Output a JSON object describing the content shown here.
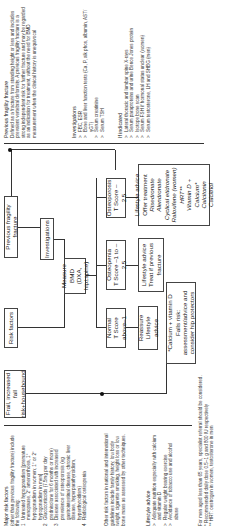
{
  "left_notes": {
    "major_risk": {
      "heading": "Major risk factors",
      "intro": "(other than previous fragility fracture) include the following:",
      "items": [
        {
          "marker": "1",
          "text": "Untreated hypogonadism [premature menopause, 2° amenorrhoea, 1° hypogonadism in women; 1° or 2° hypogonadism in men]"
        },
        {
          "marker": "2",
          "text": "Glucocorticoids (7.5mg per day prednisolone for 6 months or more)"
        },
        {
          "marker": "3",
          "text": "Disease associated with increased prevalence of osteoporosis (eg gastrointestinal disease, chronic liver disease, hyperparathyroidism, hyperthyroidism)"
        },
        {
          "marker": "4",
          "text": "Radiological osteopenia"
        }
      ]
    },
    "other_risk": "Other risk factors in national and international guidelines include family history, low body weight, cigarette smoking, height loss or low bone mass as assessed by other techniques.",
    "lifestyle": {
      "heading": "Lifestyle advice",
      "items": [
        {
          "marker": ">",
          "text": "Adequate nutrition especially with calcium and vitamin D"
        },
        {
          "marker": ">",
          "text": "Regular weight bearing exercise"
        },
        {
          "marker": ">",
          "text": "Avoidance of tobacco use and alcohol abuse"
        }
      ]
    },
    "footnotes": [
      "For men aged less than 65 years, specialist referral should be considered.",
      "* Recommended daily dose 0.5–1 g and 800 IU respectively",
      "** HRT: oestrogen in women, testosterone in men"
    ]
  },
  "flow": {
    "frail": "Frail, increased fall risk+housebound",
    "risk_factors": "Risk factors",
    "previous_fracture": "Previous fragility fracture",
    "investigations": "Investigations",
    "measure_bmd": [
      "Measure BMD",
      "(DXA, hip±spine)"
    ],
    "normal": [
      "Normal",
      "T Score above–1"
    ],
    "osteopenia": [
      "Osteopenia",
      "T Score –1 to –2.5"
    ],
    "osteoporosis": [
      "Osteoporosis",
      "T Score –2.5"
    ],
    "reassure": [
      "Reassure",
      "Lifestyle advice"
    ],
    "treat_if": [
      "Lifestyle advice",
      "Treat if previous",
      "fracture"
    ],
    "offer_treatment": {
      "lines": [
        "Lifestyle advice",
        "Offer treatment"
      ],
      "drugs": [
        "Risedronate",
        "Alendronate",
        "Cyclical etidronate",
        "Raloxifene (women)",
        "HRT**",
        "Vitamin D + Calcium*",
        "Calcitonin",
        "Calcitriol"
      ]
    },
    "calcium": [
      "*Calcium + vitamin D",
      "Falls risk:",
      "assessment/advice and",
      "consider hip protectors"
    ]
  },
  "right_notes": {
    "fracture_def": {
      "heading": "Previous fragility fracture",
      "text": "Defined as a fracture from standing height or less and includes prevalent vertebral deformity. A previous fragility fracture is a strong independent risk for further fracture and may be regarded as an indication for treatment, without the need for BMD measurement when the clinical history is unequivocal"
    },
    "investigations": {
      "heading": "Investigations",
      "items": [
        {
          "marker": ">",
          "text": "FBC, ESR"
        },
        {
          "marker": ">",
          "text": "Bone and liver function tests (Ca, P, alk phos, albumin, AST/γGT)"
        },
        {
          "marker": ">",
          "text": "Serum creatinine"
        },
        {
          "marker": ">",
          "text": "Serum TSH"
        }
      ]
    },
    "if_indicated": {
      "heading": "If indicated",
      "items": [
        {
          "marker": ">",
          "text": "Lateral thoracic and lumbar spine X-rays"
        },
        {
          "marker": ">",
          "text": "Serum paraproteins and urine Bence Jones protein"
        },
        {
          "marker": ">",
          "text": "Isotope bone scan"
        },
        {
          "marker": ">",
          "text": "Serum FSH if hormonal status unclear (women)"
        },
        {
          "marker": ">",
          "text": "Serum testosterone, LH and SHBG (men)"
        }
      ]
    }
  }
}
